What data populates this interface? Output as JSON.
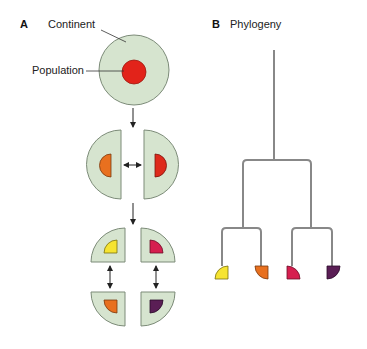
{
  "panels": {
    "a": {
      "letter": "A",
      "labels": {
        "continent": "Continent",
        "population": "Population"
      }
    },
    "b": {
      "letter": "B",
      "title": "Phylogeny"
    }
  },
  "colors": {
    "continent_fill": "#d6e4cf",
    "continent_stroke": "#7c8b78",
    "population_initial": "#e2231a",
    "population_orange": "#e8701f",
    "population_red": "#de2a1b",
    "population_yellow": "#f6e431",
    "population_crimson": "#d61f4f",
    "population_purple": "#5a1e55",
    "tree_line": "#888888",
    "arrow": "#222222"
  },
  "stages": [
    {
      "name": "single-continent",
      "populations": [
        "initial"
      ]
    },
    {
      "name": "split-in-two",
      "populations": [
        "orange",
        "red"
      ]
    },
    {
      "name": "split-in-four",
      "populations": [
        "yellow",
        "crimson",
        "orange",
        "purple"
      ]
    }
  ],
  "phylogeny": {
    "tips": [
      "yellow",
      "orange",
      "crimson",
      "purple"
    ],
    "clades": [
      [
        "yellow",
        "orange"
      ],
      [
        "crimson",
        "purple"
      ]
    ]
  }
}
